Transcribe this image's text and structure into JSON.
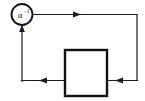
{
  "diagram": {
    "colors": {
      "stroke": "#111111",
      "wire": "#1a1a1a",
      "background": "#ffffff"
    },
    "summing_node": {
      "label_base": "α",
      "label_superscript": "−1",
      "shape": "circle",
      "cx": 22,
      "cy": 14.5,
      "r": 10.5
    },
    "block": {
      "label": "",
      "shape": "rectangle",
      "x": 65,
      "y": 50,
      "width": 42,
      "height": 46
    },
    "wires": [
      {
        "name": "forward-path-top",
        "path": "M 32.5 14.5 L 137 14.5",
        "arrow": {
          "x": 79,
          "y": 14.5,
          "dir": "right"
        }
      },
      {
        "name": "right-side-down",
        "path": "M 137 14.5 L 137 80.5",
        "arrow": null
      },
      {
        "name": "feedback-into-block-right",
        "path": "M 137 80.5 L 107 80.5",
        "arrow": {
          "x": 117,
          "y": 80.5,
          "dir": "left"
        }
      },
      {
        "name": "block-output-left",
        "path": "M 65 80.5 L 22 80.5",
        "arrow": {
          "x": 41,
          "y": 80.5,
          "dir": "left"
        }
      },
      {
        "name": "feedback-up-to-node",
        "path": "M 22 80.5 L 22 25",
        "arrow": {
          "x": 22,
          "y": 26,
          "dir": "up"
        }
      }
    ]
  }
}
